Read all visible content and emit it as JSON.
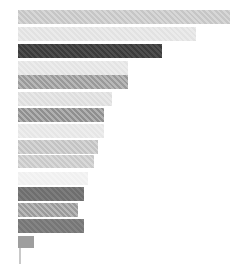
{
  "chart_data": {
    "type": "bar",
    "orientation": "horizontal",
    "title": "",
    "subtitle": "",
    "xlabel": "",
    "ylabel": "",
    "grid": false,
    "legend": null,
    "legend_position": "none",
    "xlim": [
      0,
      100
    ],
    "categories": [
      "bar-1",
      "bar-2",
      "bar-3",
      "bar-4",
      "bar-5",
      "bar-6",
      "bar-7",
      "bar-8",
      "bar-9",
      "bar-10",
      "bar-11",
      "bar-12",
      "bar-13",
      "bar-14",
      "bar-15"
    ],
    "tick_labels": [],
    "values": [
      100,
      84,
      68,
      52,
      52,
      44,
      40,
      40,
      36,
      33,
      29,
      32,
      29,
      32,
      7
    ],
    "colors": [
      "#c6c6c6",
      "#e2e2e2",
      "#3b3b3b",
      "#e4e4e4",
      "#9a9a9a",
      "#dedede",
      "#8f8f8f",
      "#e6e6e6",
      "#c3c3c3",
      "#c9c9c9",
      "#f0f0f0",
      "#6e6e6e",
      "#9b9b9b",
      "#767676",
      "#9e9e9e"
    ],
    "hatched": [
      true,
      true,
      true,
      true,
      true,
      true,
      true,
      true,
      true,
      true,
      true,
      true,
      true,
      true,
      false
    ],
    "bar_geometry_px": [
      {
        "x": 18,
        "y": 10,
        "w": 212,
        "h": 14
      },
      {
        "x": 18,
        "y": 27,
        "w": 178,
        "h": 14
      },
      {
        "x": 18,
        "y": 44,
        "w": 144,
        "h": 14
      },
      {
        "x": 18,
        "y": 61,
        "w": 110,
        "h": 14
      },
      {
        "x": 18,
        "y": 75,
        "w": 110,
        "h": 14
      },
      {
        "x": 18,
        "y": 92,
        "w": 94,
        "h": 14
      },
      {
        "x": 18,
        "y": 108,
        "w": 86,
        "h": 14
      },
      {
        "x": 18,
        "y": 124,
        "w": 86,
        "h": 14
      },
      {
        "x": 18,
        "y": 140,
        "w": 80,
        "h": 14
      },
      {
        "x": 18,
        "y": 155,
        "w": 76,
        "h": 13
      },
      {
        "x": 18,
        "y": 172,
        "w": 70,
        "h": 13
      },
      {
        "x": 18,
        "y": 187,
        "w": 66,
        "h": 14
      },
      {
        "x": 18,
        "y": 203,
        "w": 60,
        "h": 14
      },
      {
        "x": 18,
        "y": 219,
        "w": 66,
        "h": 14
      },
      {
        "x": 18,
        "y": 236,
        "w": 16,
        "h": 12
      }
    ],
    "axis": {
      "visible": true,
      "color": "#c9c9c9",
      "x": 19,
      "y": 248,
      "width": 2,
      "height": 16
    },
    "background": "#ffffff"
  }
}
